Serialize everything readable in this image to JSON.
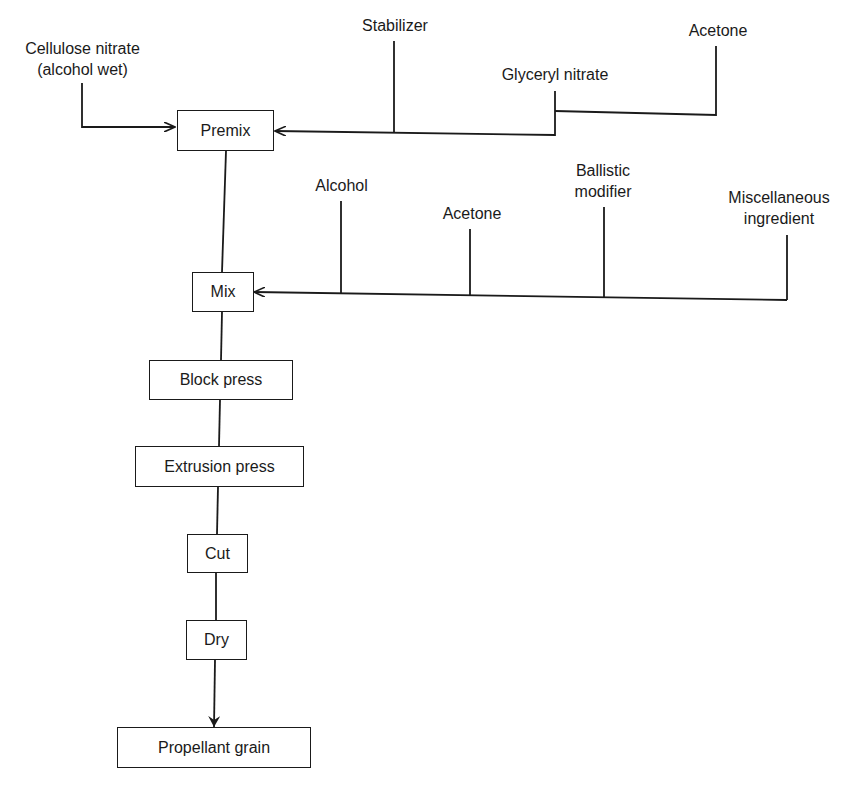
{
  "diagram": {
    "type": "process-flow",
    "processes": {
      "premix": "Premix",
      "mix": "Mix",
      "block_press": "Block press",
      "extrusion_press": "Extrusion press",
      "cut": "Cut",
      "dry": "Dry",
      "propellant_grain": "Propellant grain"
    },
    "inputs": {
      "premix": {
        "cellulose_nitrate_line1": "Cellulose nitrate",
        "cellulose_nitrate_line2": "(alcohol wet)",
        "stabilizer": "Stabilizer",
        "glyceryl_nitrate": "Glyceryl nitrate",
        "acetone": "Acetone"
      },
      "mix": {
        "alcohol": "Alcohol",
        "acetone": "Acetone",
        "ballistic_modifier_line1": "Ballistic",
        "ballistic_modifier_line2": "modifier",
        "misc_ingredient_line1": "Miscellaneous",
        "misc_ingredient_line2": "ingredient"
      }
    },
    "flow": [
      "Premix",
      "Mix",
      "Block press",
      "Extrusion press",
      "Cut",
      "Dry",
      "Propellant grain"
    ]
  }
}
